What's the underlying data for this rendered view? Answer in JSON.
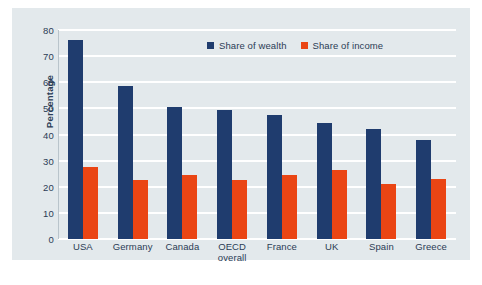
{
  "chart_data": {
    "type": "bar",
    "title": "",
    "xlabel": "",
    "ylabel": "Percentage",
    "ylim": [
      0,
      80
    ],
    "yticks": [
      0,
      10,
      20,
      30,
      40,
      50,
      60,
      70,
      80
    ],
    "grid": true,
    "legend_position": "top-center",
    "categories": [
      "USA",
      "Germany",
      "Canada",
      "OECD overall",
      "France",
      "UK",
      "Spain",
      "Greece"
    ],
    "category_lines": [
      [
        "USA"
      ],
      [
        "Germany"
      ],
      [
        "Canada"
      ],
      [
        "OECD",
        "overall"
      ],
      [
        "France"
      ],
      [
        "UK"
      ],
      [
        "Spain"
      ],
      [
        "Greece"
      ]
    ],
    "series": [
      {
        "name": "Share of wealth",
        "color": "#1f3c6e",
        "values": [
          76,
          58.5,
          50.5,
          49.5,
          47.5,
          44.5,
          42,
          38
        ]
      },
      {
        "name": "Share of income",
        "color": "#ea4514",
        "values": [
          27.5,
          22.5,
          24.5,
          22.5,
          24.5,
          26.5,
          21,
          23
        ]
      }
    ]
  },
  "legend": {
    "items": [
      {
        "label": "Share of wealth",
        "color": "#1f3c6e"
      },
      {
        "label": "Share of income",
        "color": "#ea4514"
      }
    ]
  },
  "axes": {
    "y_title": "Percentage"
  },
  "caption": {
    "text": ""
  },
  "colors": {
    "panel_background": "#e3e9ec",
    "page_background": "#ffffff",
    "gridline": "#ffffff",
    "text": "#2b3c55",
    "wealth": "#1f3c6e",
    "income": "#ea4514"
  }
}
